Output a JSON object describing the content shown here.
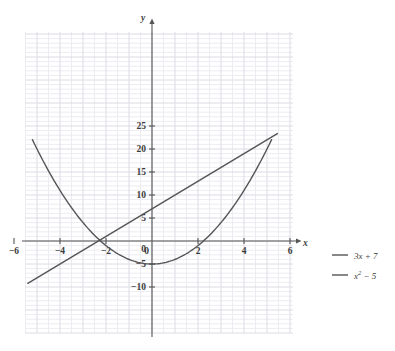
{
  "chart_data": {
    "type": "line",
    "title": "",
    "xlabel": "x",
    "ylabel": "y",
    "xlim": [
      -6.6,
      6.6
    ],
    "ylim": [
      -10.6,
      26.0
    ],
    "grid": true,
    "grid_minor_step": 0.5,
    "grid_major_step": 1,
    "legend_position": "right",
    "xticks": [
      -6,
      -4,
      -2,
      0,
      2,
      4,
      6
    ],
    "xtick_labels": [
      "−6",
      "−4",
      "−2",
      "0",
      "2",
      "4",
      "6"
    ],
    "yticks": [
      -10,
      -5,
      0,
      5,
      10,
      15,
      20,
      25
    ],
    "ytick_labels": [
      "−10",
      "−5",
      "0",
      "5",
      "10",
      "15",
      "20",
      "25"
    ],
    "series": [
      {
        "name": "3x + 7",
        "label_main": "3x + 7",
        "label_sup": "",
        "type": "line",
        "color": "#555555",
        "domain": [
          -5.4,
          5.45
        ],
        "expression": "3*x+7",
        "points": [
          {
            "x": -5.4,
            "y": -9.2
          },
          {
            "x": -4.0,
            "y": -5.0
          },
          {
            "x": -3.0,
            "y": -2.0
          },
          {
            "x": -2.3333,
            "y": 0.0
          },
          {
            "x": -2.0,
            "y": 1.0
          },
          {
            "x": -1.0,
            "y": 4.0
          },
          {
            "x": 0.0,
            "y": 7.0
          },
          {
            "x": 1.0,
            "y": 10.0
          },
          {
            "x": 2.0,
            "y": 13.0
          },
          {
            "x": 3.0,
            "y": 16.0
          },
          {
            "x": 4.0,
            "y": 19.0
          },
          {
            "x": 5.0,
            "y": 22.0
          },
          {
            "x": 5.45,
            "y": 23.35
          }
        ]
      },
      {
        "name": "x^2 - 5",
        "label_main": "x",
        "label_sup": "2",
        "label_tail": " − 5",
        "type": "parabola",
        "color": "#555555",
        "domain": [
          -5.2,
          5.2
        ],
        "expression": "x^2-5",
        "vertex": {
          "x": 0,
          "y": -5
        },
        "roots": [
          -2.236,
          2.236
        ],
        "points": [
          {
            "x": -5.2,
            "y": 22.04
          },
          {
            "x": -4.5,
            "y": 15.25
          },
          {
            "x": -4.0,
            "y": 11.0
          },
          {
            "x": -3.0,
            "y": 4.0
          },
          {
            "x": -2.236,
            "y": 0.0
          },
          {
            "x": -2.0,
            "y": -1.0
          },
          {
            "x": -1.0,
            "y": -4.0
          },
          {
            "x": 0.0,
            "y": -5.0
          },
          {
            "x": 1.0,
            "y": -4.0
          },
          {
            "x": 2.0,
            "y": -1.0
          },
          {
            "x": 2.236,
            "y": 0.0
          },
          {
            "x": 3.0,
            "y": 4.0
          },
          {
            "x": 4.0,
            "y": 11.0
          },
          {
            "x": 4.5,
            "y": 15.25
          },
          {
            "x": 5.2,
            "y": 22.04
          }
        ]
      }
    ],
    "intersections": [
      {
        "x": -2.0,
        "y": 1.0
      },
      {
        "x": 6.0,
        "y": 25.0
      }
    ],
    "colors": {
      "axis": "#555555",
      "curve": "#555555",
      "grid_minor": "#ececf2",
      "grid_major": "#dcdce4",
      "text": "#3b3b3b",
      "background": "#ffffff"
    }
  },
  "legend": {
    "entries": [
      {
        "label": "3x + 7"
      },
      {
        "label": "x² − 5"
      }
    ]
  }
}
